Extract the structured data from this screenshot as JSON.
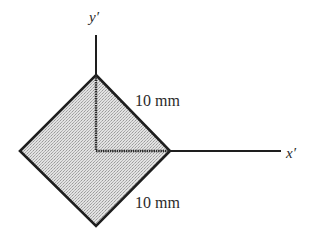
{
  "diagram": {
    "type": "geometry-cross-section",
    "axes": {
      "x_label": "x′",
      "y_label": "y′"
    },
    "dimensions": {
      "top_edge_label": "10 mm",
      "bottom_edge_label": "10 mm"
    },
    "colors": {
      "fill": "#d6d6d6",
      "stroke": "#1e1e1e",
      "text": "#2a2a2a"
    }
  }
}
